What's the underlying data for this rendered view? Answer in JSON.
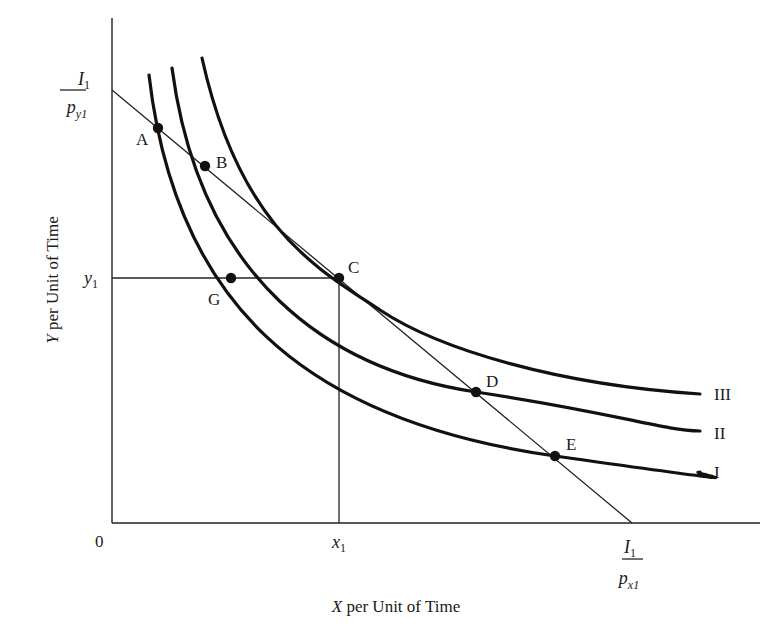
{
  "diagram": {
    "type": "indifference-curve-budget-line",
    "axes": {
      "origin_label": "0",
      "x_label_var": "X",
      "x_label_rest": " per Unit of Time",
      "y_label_var": "Y",
      "y_label_rest": " per Unit of Time"
    },
    "intercepts": {
      "y_intercept": {
        "numerator": "I",
        "numerator_sub": "1",
        "denominator": "p",
        "denominator_sub": "y1"
      },
      "x_intercept": {
        "numerator": "I",
        "numerator_sub": "1",
        "denominator": "p",
        "denominator_sub": "x1"
      }
    },
    "ticks": {
      "x1": {
        "var": "x",
        "sub": "1"
      },
      "y1": {
        "var": "y",
        "sub": "1"
      }
    },
    "curves": [
      {
        "id": "I",
        "label": "I"
      },
      {
        "id": "II",
        "label": "II"
      },
      {
        "id": "III",
        "label": "III"
      }
    ],
    "points": [
      {
        "id": "A",
        "label": "A",
        "curve": "I",
        "on_budget_line": true
      },
      {
        "id": "B",
        "label": "B",
        "curve": "II",
        "on_budget_line": true
      },
      {
        "id": "C",
        "label": "C",
        "curve": "III",
        "on_budget_line": true,
        "tangent": true
      },
      {
        "id": "D",
        "label": "D",
        "curve": "II",
        "on_budget_line": true
      },
      {
        "id": "E",
        "label": "E",
        "curve": "I",
        "on_budget_line": true
      },
      {
        "id": "G",
        "label": "G",
        "curve": "I",
        "on_budget_line": false
      }
    ]
  }
}
